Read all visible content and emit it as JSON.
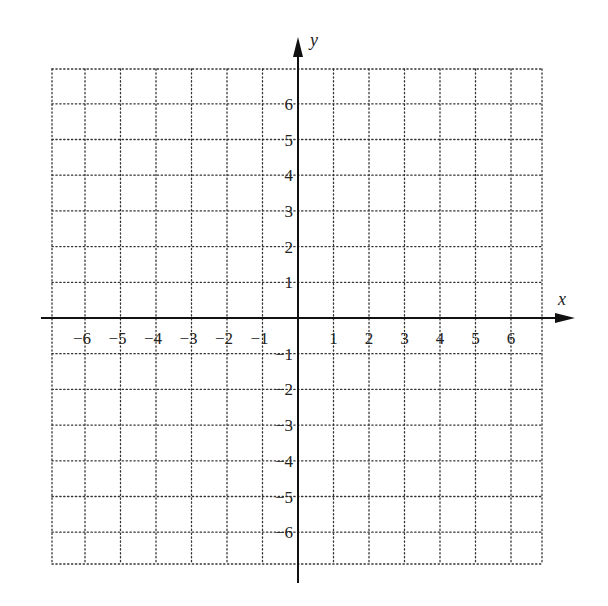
{
  "chart_data": {
    "type": "scatter",
    "title": "",
    "xlabel": "x",
    "ylabel": "y",
    "xlim": [
      -6.7,
      6.7
    ],
    "ylim": [
      -6.7,
      6.7
    ],
    "grid": true,
    "grid_style": "dotted",
    "x_ticks": [
      -6,
      -5,
      -4,
      -3,
      -2,
      -1,
      1,
      2,
      3,
      4,
      5,
      6
    ],
    "y_ticks": [
      6,
      5,
      4,
      3,
      2,
      1,
      -1,
      -2,
      -3,
      -4,
      -5,
      -6
    ],
    "x_tick_labels": [
      "−6",
      "−5",
      "−4",
      "−3",
      "−2",
      "−1",
      "1",
      "2",
      "3",
      "4",
      "5",
      "6"
    ],
    "y_tick_labels": [
      "6",
      "5",
      "4",
      "3",
      "2",
      "1",
      "−1",
      "−2",
      "−3",
      "−4",
      "−5",
      "−6"
    ],
    "series": []
  },
  "layout": {
    "origin": [
      298,
      318
    ],
    "unit_x": 35.5,
    "unit_y": 35.7,
    "grid_left": 52,
    "grid_right": 542,
    "grid_top": 69,
    "grid_bottom": 564,
    "x_axis_start": 41,
    "x_axis_end": 575,
    "y_axis_top": 37,
    "y_axis_bottom": 583,
    "axis_color": "#111111",
    "grid_color": "#333333"
  }
}
